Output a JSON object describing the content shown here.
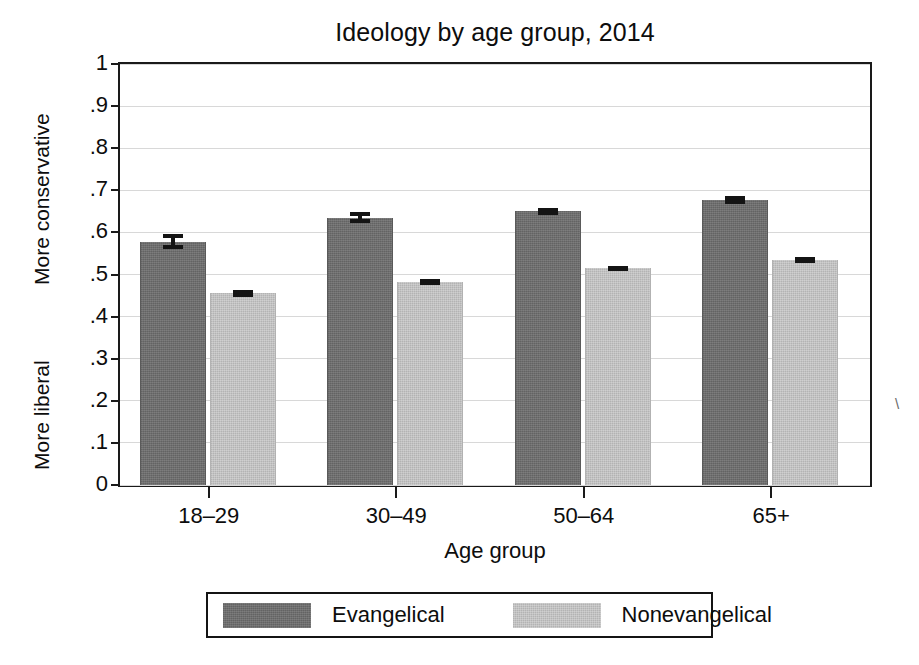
{
  "chart_data": {
    "type": "bar",
    "title": "Ideology by age group, 2014",
    "xlabel": "Age group",
    "ylabel": "",
    "ylim": [
      0,
      1
    ],
    "ytick_labels": [
      "0",
      ".1",
      ".2",
      ".3",
      ".4",
      ".5",
      ".6",
      ".7",
      ".8",
      ".9",
      "1"
    ],
    "ytick_values": [
      0,
      0.1,
      0.2,
      0.3,
      0.4,
      0.5,
      0.6,
      0.7,
      0.8,
      0.9,
      1
    ],
    "y_axis_high_caption": "More conservative",
    "y_axis_low_caption": "More liberal",
    "grid": true,
    "legend_position": "bottom",
    "categories": [
      "18–29",
      "30–49",
      "50–64",
      "65+"
    ],
    "series": [
      {
        "name": "Evangelical",
        "color": "#6e6e6e",
        "values": [
          0.578,
          0.635,
          0.65,
          0.677
        ],
        "errors": [
          0.018,
          0.013,
          0.009,
          0.01
        ]
      },
      {
        "name": "Nonevangelical",
        "color": "#c2c2c2",
        "values": [
          0.455,
          0.482,
          0.515,
          0.535
        ],
        "errors": [
          0.009,
          0.007,
          0.006,
          0.007
        ]
      }
    ],
    "error_bar_style": "capped vertical interval"
  },
  "legend": {
    "entries": [
      {
        "label": "Evangelical",
        "swatch": "dark-gray-swatch"
      },
      {
        "label": "Nonevangelical",
        "swatch": "light-gray-swatch"
      }
    ]
  },
  "artifacts": {
    "scan_mark": "\\"
  }
}
